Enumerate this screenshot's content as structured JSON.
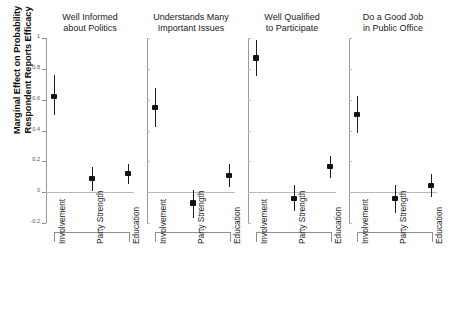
{
  "chart_data": {
    "type": "scatter",
    "title": "",
    "ylabel": "Marginal Effect on Probability\nRespondent Reports Efficacy",
    "xlabel": "",
    "ylim": [
      -0.2,
      1.0
    ],
    "yticks": [
      -0.2,
      0,
      0.2,
      0.4,
      0.6,
      0.8,
      1
    ],
    "ytick_labels": [
      "-0.2",
      "0",
      "0.2",
      "0.4",
      "0.6",
      "0.8",
      "1"
    ],
    "grid": false,
    "legend": "none",
    "zero_reference_line": 0,
    "categories": [
      "Involvement",
      "Party Strength",
      "Education"
    ],
    "panels": [
      {
        "title": "Well Informed\nabout Politics",
        "points": [
          {
            "category": "Involvement",
            "estimate": 0.62,
            "ci_low": 0.5,
            "ci_high": 0.76
          },
          {
            "category": "Party Strength",
            "estimate": 0.09,
            "ci_low": 0.01,
            "ci_high": 0.165
          },
          {
            "category": "Education",
            "estimate": 0.12,
            "ci_low": 0.05,
            "ci_high": 0.185
          }
        ]
      },
      {
        "title": "Understands Many\nImportant Issues",
        "points": [
          {
            "category": "Involvement",
            "estimate": 0.55,
            "ci_low": 0.425,
            "ci_high": 0.675
          },
          {
            "category": "Party Strength",
            "estimate": -0.07,
            "ci_low": -0.165,
            "ci_high": 0.015
          },
          {
            "category": "Education",
            "estimate": 0.11,
            "ci_low": 0.035,
            "ci_high": 0.185
          }
        ]
      },
      {
        "title": "Well Qualified\nto Participate",
        "points": [
          {
            "category": "Involvement",
            "estimate": 0.87,
            "ci_low": 0.755,
            "ci_high": 0.985
          },
          {
            "category": "Party Strength",
            "estimate": -0.04,
            "ci_low": -0.125,
            "ci_high": 0.045
          },
          {
            "category": "Education",
            "estimate": 0.165,
            "ci_low": 0.095,
            "ci_high": 0.235
          }
        ]
      },
      {
        "title": "Do a Good Job\nin Public Office",
        "points": [
          {
            "category": "Involvement",
            "estimate": 0.505,
            "ci_low": 0.385,
            "ci_high": 0.625
          },
          {
            "category": "Party Strength",
            "estimate": -0.04,
            "ci_low": -0.135,
            "ci_high": 0.045
          },
          {
            "category": "Education",
            "estimate": 0.045,
            "ci_low": -0.03,
            "ci_high": 0.115
          }
        ]
      }
    ]
  },
  "colors": {
    "point": "#121212",
    "interval": "#1d1d1d",
    "axis": "#9a9a9a",
    "zero_line": "#b9b9b9",
    "text": "#1a1a1a",
    "background": "#ffffff"
  }
}
